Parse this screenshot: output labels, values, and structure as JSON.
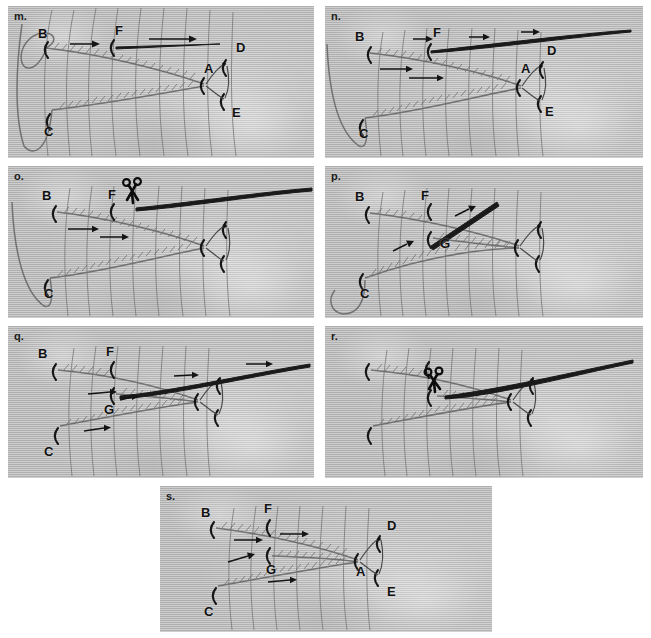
{
  "figure": {
    "caption_present": false,
    "background_color": "#c3c3c3",
    "ink_color": "#151515",
    "panel_count": 7
  },
  "panels": [
    {
      "id": "m",
      "label": "m.",
      "x": 8,
      "y": 6,
      "w": 306,
      "h": 152,
      "point_labels": [
        {
          "text": "B",
          "x": 30,
          "y": 28
        },
        {
          "text": "F",
          "x": 107,
          "y": 25
        },
        {
          "text": "D",
          "x": 228,
          "y": 42
        },
        {
          "text": "A",
          "x": 208,
          "y": 62
        },
        {
          "text": "E",
          "x": 228,
          "y": 107
        },
        {
          "text": "C",
          "x": 40,
          "y": 122
        }
      ],
      "arrows": [
        {
          "x1": 62,
          "y1": 38,
          "x2": 88,
          "y2": 38
        },
        {
          "x1": 141,
          "y1": 33,
          "x2": 185,
          "y2": 33
        }
      ],
      "has_scissors": false,
      "has_loop": true,
      "long_fiber": false
    },
    {
      "id": "n",
      "label": "n.",
      "x": 325,
      "y": 6,
      "w": 318,
      "h": 152,
      "point_labels": [
        {
          "text": "B",
          "x": 34,
          "y": 31
        },
        {
          "text": "F",
          "x": 111,
          "y": 27
        },
        {
          "text": "D",
          "x": 225,
          "y": 45
        },
        {
          "text": "A",
          "x": 206,
          "y": 62
        },
        {
          "text": "E",
          "x": 224,
          "y": 105
        },
        {
          "text": "C",
          "x": 38,
          "y": 124
        }
      ],
      "arrows": [
        {
          "x1": 88,
          "y1": 33,
          "x2": 105,
          "y2": 33
        },
        {
          "x1": 144,
          "y1": 31,
          "x2": 162,
          "y2": 31
        },
        {
          "x1": 196,
          "y1": 26,
          "x2": 212,
          "y2": 26
        },
        {
          "x1": 55,
          "y1": 63,
          "x2": 85,
          "y2": 63
        },
        {
          "x1": 84,
          "y1": 72,
          "x2": 116,
          "y2": 72
        }
      ],
      "has_scissors": false,
      "has_loop": true,
      "long_fiber": true
    },
    {
      "id": "o",
      "label": "o.",
      "x": 8,
      "y": 166,
      "w": 306,
      "h": 152,
      "point_labels": [
        {
          "text": "B",
          "x": 36,
          "y": 29
        },
        {
          "text": "F",
          "x": 102,
          "y": 28
        },
        {
          "text": "C",
          "x": 40,
          "y": 122
        }
      ],
      "arrows": [
        {
          "x1": 60,
          "y1": 63,
          "x2": 88,
          "y2": 63
        },
        {
          "x1": 92,
          "y1": 71,
          "x2": 118,
          "y2": 71
        }
      ],
      "has_scissors": true,
      "scissors": {
        "x": 120,
        "y": 28
      },
      "has_loop": true,
      "long_fiber": true
    },
    {
      "id": "p",
      "label": "p.",
      "x": 325,
      "y": 166,
      "w": 318,
      "h": 152,
      "point_labels": [
        {
          "text": "B",
          "x": 34,
          "y": 30
        },
        {
          "text": "F",
          "x": 98,
          "y": 29
        },
        {
          "text": "G",
          "x": 119,
          "y": 76
        },
        {
          "text": "C",
          "x": 39,
          "y": 125
        }
      ],
      "arrows": [
        {
          "x1": 132,
          "y1": 48,
          "x2": 150,
          "y2": 40
        },
        {
          "x1": 70,
          "y1": 83,
          "x2": 86,
          "y2": 75
        }
      ],
      "has_scissors": false,
      "has_loop": true,
      "long_fiber": false,
      "diagonal_fiber": true
    },
    {
      "id": "q",
      "label": "q.",
      "x": 8,
      "y": 326,
      "w": 306,
      "h": 152,
      "point_labels": [
        {
          "text": "B",
          "x": 34,
          "y": 28
        },
        {
          "text": "F",
          "x": 100,
          "y": 26
        },
        {
          "text": "G",
          "x": 100,
          "y": 80
        },
        {
          "text": "C",
          "x": 40,
          "y": 120
        }
      ],
      "arrows": [
        {
          "x1": 166,
          "y1": 50,
          "x2": 188,
          "y2": 48
        },
        {
          "x1": 238,
          "y1": 38,
          "x2": 262,
          "y2": 38
        },
        {
          "x1": 80,
          "y1": 68,
          "x2": 106,
          "y2": 66
        },
        {
          "x1": 112,
          "y1": 74,
          "x2": 128,
          "y2": 71
        },
        {
          "x1": 76,
          "y1": 105,
          "x2": 100,
          "y2": 101
        }
      ],
      "has_scissors": false,
      "has_loop": false,
      "long_fiber": true
    },
    {
      "id": "r",
      "label": "r.",
      "x": 325,
      "y": 326,
      "w": 318,
      "h": 152,
      "point_labels": [],
      "arrows": [],
      "has_scissors": true,
      "scissors": {
        "x": 110,
        "y": 52
      },
      "has_loop": false,
      "long_fiber": true
    },
    {
      "id": "s",
      "label": "s.",
      "x": 160,
      "y": 486,
      "w": 332,
      "h": 146,
      "point_labels": [
        {
          "text": "B",
          "x": 45,
          "y": 27
        },
        {
          "text": "F",
          "x": 107,
          "y": 22
        },
        {
          "text": "D",
          "x": 230,
          "y": 38
        },
        {
          "text": "G",
          "x": 110,
          "y": 80
        },
        {
          "text": "A",
          "x": 198,
          "y": 82
        },
        {
          "text": "E",
          "x": 230,
          "y": 102
        },
        {
          "text": "C",
          "x": 48,
          "y": 122
        }
      ],
      "arrows": [
        {
          "x1": 120,
          "y1": 48,
          "x2": 146,
          "y2": 48
        },
        {
          "x1": 74,
          "y1": 54,
          "x2": 100,
          "y2": 54
        },
        {
          "x1": 68,
          "y1": 76,
          "x2": 96,
          "y2": 68
        },
        {
          "x1": 108,
          "y1": 96,
          "x2": 136,
          "y2": 94
        }
      ],
      "has_scissors": false,
      "has_loop": false,
      "long_fiber": false
    }
  ],
  "legend": {
    "point_meanings": [
      "A",
      "B",
      "C",
      "D",
      "E",
      "F",
      "G"
    ],
    "scissors_icon_name": "scissors-icon",
    "arrow_icon_name": "arrow-right-icon"
  }
}
